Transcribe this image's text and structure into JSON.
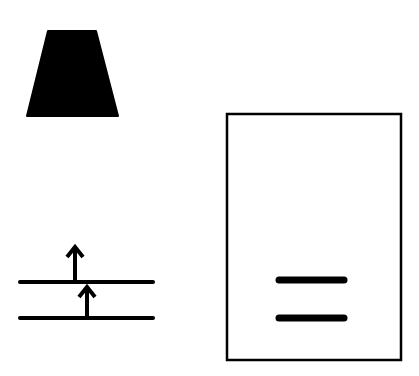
{
  "canvas": {
    "width": 419,
    "height": 376,
    "background": "#ffffff"
  },
  "colors": {
    "ink": "#000000"
  },
  "shapes": {
    "trapezoid": {
      "top_left": [
        48,
        31
      ],
      "top_right": [
        96,
        31
      ],
      "bottom_right": [
        118,
        116
      ],
      "bottom_left": [
        27,
        116
      ]
    },
    "levels": [
      {
        "x1": 20,
        "x2": 153,
        "y": 282
      },
      {
        "x1": 20,
        "x2": 153,
        "y": 318
      }
    ],
    "arrows": [
      {
        "x": 75,
        "y_start": 282,
        "y_end": 247,
        "direction": "up"
      },
      {
        "x": 87,
        "y_start": 318,
        "y_end": 287,
        "direction": "up"
      }
    ],
    "box": {
      "x": 227,
      "y": 114,
      "width": 174,
      "height": 246
    },
    "bars": [
      {
        "x1": 279,
        "x2": 344,
        "y": 280
      },
      {
        "x1": 279,
        "x2": 344,
        "y": 318
      }
    ]
  }
}
